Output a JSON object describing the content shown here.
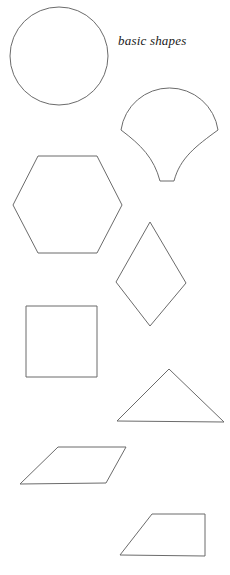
{
  "page": {
    "title": "basic shapes",
    "background_color": "#ffffff",
    "width": 230,
    "height": 575
  },
  "label": {
    "text": "basic shapes",
    "color": "#1a1a1a",
    "style": "italic"
  },
  "style": {
    "stroke_color": "#6b6b6b",
    "stroke_width": 1,
    "fill": "none"
  },
  "shapes": [
    {
      "name": "circle",
      "label": "circle",
      "kind": "ellipse",
      "cx": 59,
      "cy": 56,
      "rx": 49,
      "ry": 49
    },
    {
      "name": "fan",
      "label": "fan",
      "kind": "path",
      "d": "M 121 130 A 49 49 0 0 1 218 130 C 196 146 180 158 174 181 L 160 181 C 154 158 141 145 121 130 Z"
    },
    {
      "name": "hexagon",
      "label": "hexagon",
      "kind": "polygon",
      "points": "38,156 97,156 122,205 97,253 38,253 13,205"
    },
    {
      "name": "rhombus",
      "label": "rhombus",
      "kind": "polygon",
      "points": "150,222 186,283 150,326 116,282"
    },
    {
      "name": "square",
      "label": "square",
      "kind": "rect",
      "x": 26,
      "y": 306,
      "width": 71,
      "height": 71
    },
    {
      "name": "triangle",
      "label": "triangle",
      "kind": "polygon",
      "points": "169,369 224,422 117,421"
    },
    {
      "name": "parallelogram",
      "label": "parallelogram",
      "kind": "polygon",
      "points": "58,447 126,447 106,483 20,484"
    },
    {
      "name": "trapezoid",
      "label": "trapezoid",
      "kind": "polygon",
      "points": "152,514 205,514 205,556 120,555"
    }
  ]
}
